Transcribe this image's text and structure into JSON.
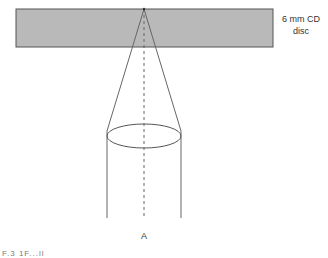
{
  "diagram": {
    "title": "",
    "disc": {
      "label_line1": "6 mm CD",
      "label_line2": "disc",
      "fill": "#b9b9b9",
      "stroke": "#555555"
    },
    "beam": {
      "stroke": "#666666"
    },
    "lens": {
      "stroke": "#555555"
    },
    "axis": {
      "stroke": "#666666",
      "style": "dashed"
    },
    "point_label": "A",
    "caption_fragment": "F.3  1F...ll"
  }
}
